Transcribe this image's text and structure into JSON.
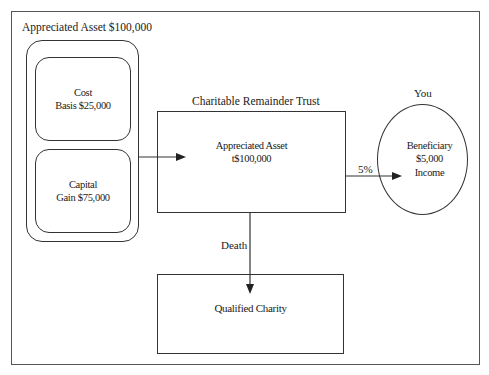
{
  "diagram": {
    "type": "flow",
    "asset_group": {
      "title": "Appreciated  Asset  $100,000",
      "cost_box": {
        "line1": "Cost",
        "line2": "Basis $25,000"
      },
      "gain_box": {
        "line1": "Capital",
        "line2": "Gain $75,000"
      }
    },
    "trust": {
      "title": "Charitable  Remainder  Trust",
      "line1": "Appreciated Asset",
      "line2": "t$100,000"
    },
    "beneficiary": {
      "title": "You",
      "line1": "Beneficiary",
      "line2": "$5,000",
      "line3": "Income"
    },
    "charity": {
      "label": "Qualified Charity"
    },
    "edges": [
      {
        "from": "asset_group",
        "to": "trust",
        "label": ""
      },
      {
        "from": "trust",
        "to": "beneficiary",
        "label": "5%"
      },
      {
        "from": "trust",
        "to": "charity",
        "label": "Death"
      }
    ],
    "colors": {
      "line": "#333333",
      "background": "#ffffff"
    }
  }
}
